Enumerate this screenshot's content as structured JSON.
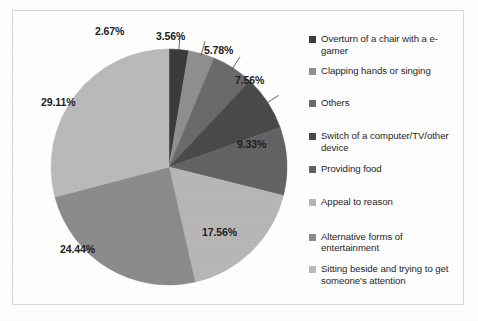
{
  "chart_data": {
    "type": "pie",
    "title": "",
    "legend_position": "right",
    "categories": [
      "Overturn of a chair with a e-gamer",
      "Clapping hands or singing",
      "Others",
      "Switch of a computer/TV/other device",
      "Providing food",
      "Appeal to reason",
      "Alternative forms of entertainment",
      "Sitting beside and trying to get someone's attention"
    ],
    "values": [
      2.67,
      3.56,
      5.78,
      7.56,
      9.33,
      17.56,
      24.44,
      29.11
    ],
    "value_labels": [
      "2.67%",
      "3.56%",
      "5.78%",
      "7.56%",
      "9.33%",
      "17.56%",
      "24.44%",
      "29.11%"
    ],
    "unit": "%",
    "colors": [
      "#3b3b3b",
      "#8f8f8f",
      "#6a6a6a",
      "#4a4a4a",
      "#636363",
      "#b6b6b6",
      "#8b8b8b",
      "#b9b9b9"
    ]
  },
  "legend": {
    "items": [
      {
        "label": "Overturn of a chair with a e-gamer",
        "color": "#3b3b3b"
      },
      {
        "label": "Clapping hands or singing",
        "color": "#8f8f8f"
      },
      {
        "label": "Others",
        "color": "#6a6a6a"
      },
      {
        "label": "Switch of a computer/TV/other device",
        "color": "#4a4a4a"
      },
      {
        "label": "Providing food",
        "color": "#636363"
      },
      {
        "label": "Appeal to reason",
        "color": "#b6b6b6"
      },
      {
        "label": "Alternative forms of entertainment",
        "color": "#8b8b8b"
      },
      {
        "label": "Sitting beside and trying to get someone's attention",
        "color": "#b9b9b9"
      }
    ]
  },
  "labels": {
    "l0": "2.67%",
    "l1": "3.56%",
    "l2": "5.78%",
    "l3": "7.56%",
    "l4": "9.33%",
    "l5": "17.56%",
    "l6": "24.44%",
    "l7": "29.11%"
  }
}
